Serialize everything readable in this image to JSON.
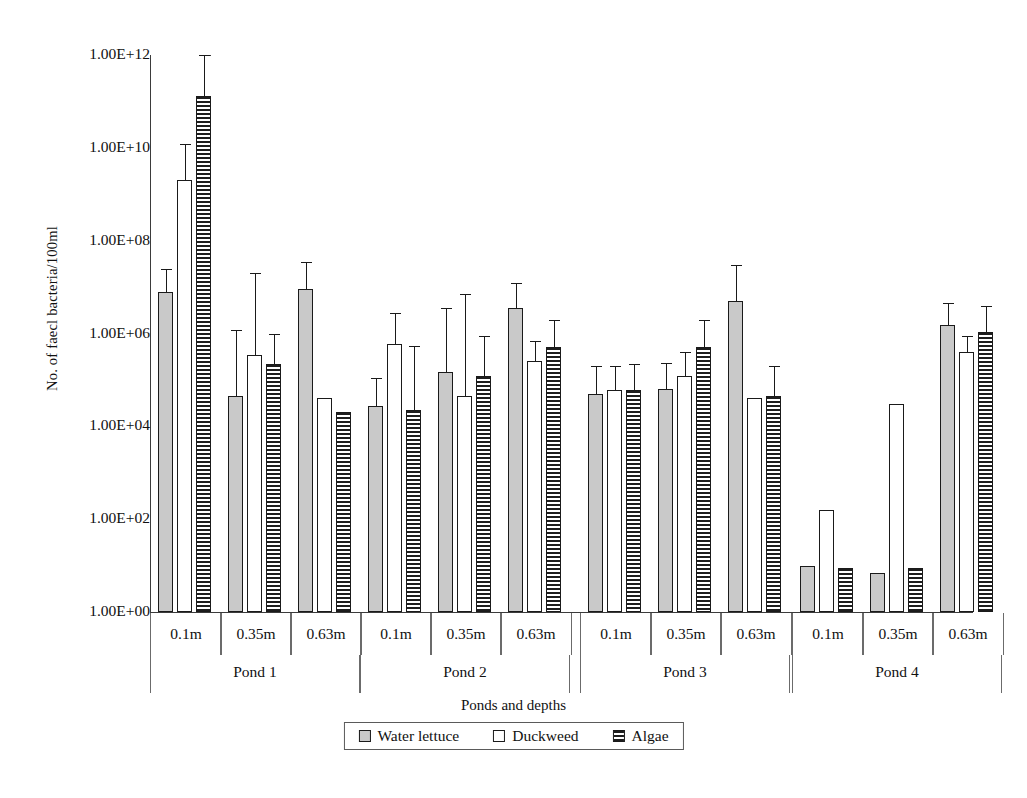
{
  "chart_data": {
    "type": "bar",
    "title": "",
    "xlabel": "Ponds and depths",
    "ylabel": "No. of faecl bacteria/100ml",
    "yscale": "log",
    "ylim": [
      1,
      1000000000000
    ],
    "ytick_labels": [
      "1.00E+12",
      "1.00E+10",
      "1.00E+08",
      "1.00E+06",
      "1.00E+04",
      "1.00E+02",
      "1.00E+00"
    ],
    "ytick_values": [
      1000000000000,
      10000000000,
      100000000,
      1000000,
      10000,
      100,
      1
    ],
    "grid": false,
    "legend_position": "bottom",
    "groups": [
      "Pond 1",
      "Pond 2",
      "Pond 3",
      "Pond 4"
    ],
    "depths": [
      "0.1m",
      "0.35m",
      "0.63m"
    ],
    "categories": [
      "Pond 1 / 0.1m",
      "Pond 1 / 0.35m",
      "Pond 1 / 0.63m",
      "Pond 2 / 0.1m",
      "Pond 2 / 0.35m",
      "Pond 2 / 0.63m",
      "Pond 3 / 0.1m",
      "Pond 3 / 0.35m",
      "Pond 3 / 0.63m",
      "Pond 4 / 0.1m",
      "Pond 4 / 0.35m",
      "Pond 4 / 0.63m"
    ],
    "series": [
      {
        "name": "Water lettuce",
        "fill": "#c9c9c9",
        "values": [
          8000000.0,
          45000.0,
          9000000.0,
          27000.0,
          150000.0,
          3500000.0,
          50000.0,
          65000.0,
          5000000.0,
          10.0,
          7.0,
          1500000.0
        ],
        "errors_upper": [
          25000000.0,
          1200000.0,
          35000000.0,
          110000.0,
          3500000.0,
          12000000.0,
          200000.0,
          230000.0,
          30000000.0,
          0,
          0,
          4500000.0
        ]
      },
      {
        "name": "Duckweed",
        "fill": "#ffffff",
        "values": [
          2000000000.0,
          350000.0,
          40000.0,
          600000.0,
          45000.0,
          250000.0,
          60000.0,
          120000.0,
          40000.0,
          160.0,
          30000.0,
          400000.0
        ],
        "errors_upper": [
          12000000000.0,
          20000000.0,
          0,
          2800000.0,
          7000000.0,
          700000.0,
          200000.0,
          400000.0,
          0,
          0,
          0,
          900000.0
        ]
      },
      {
        "name": "Algae",
        "fill": "repeating-horizontal-stripes",
        "values": [
          130000000000.0,
          220000.0,
          20000.0,
          22000.0,
          120000.0,
          500000.0,
          60000.0,
          500000.0,
          45000.0,
          9.0,
          9.0,
          1100000.0
        ],
        "errors_upper": [
          1000000000000.0,
          1000000.0,
          0,
          550000.0,
          900000.0,
          2000000.0,
          220000.0,
          2000000.0,
          200000.0,
          0,
          0,
          4000000.0
        ]
      }
    ],
    "legend": [
      "Water lettuce",
      "Duckweed",
      "Algae"
    ]
  }
}
